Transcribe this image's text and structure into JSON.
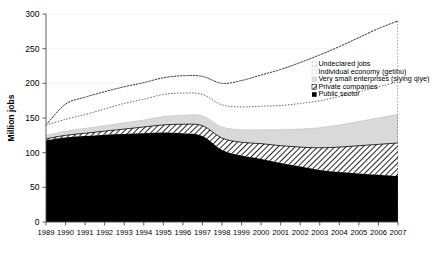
{
  "chart_data": {
    "type": "area",
    "title": "",
    "subtitle": "",
    "xlabel": "",
    "ylabel": "Million jobs",
    "stacked": true,
    "grid": false,
    "legend_position": "upper-right",
    "xlim": [
      1989,
      2007
    ],
    "ylim": [
      0,
      300
    ],
    "ytick_values": [
      0,
      50,
      100,
      150,
      200,
      250,
      300
    ],
    "ytick_labels": [
      "0",
      "50",
      "100",
      "150",
      "200",
      "250",
      "300"
    ],
    "categories": [
      "1989",
      "1990",
      "1991",
      "1992",
      "1993",
      "1994",
      "1995",
      "1996",
      "1997",
      "1998",
      "1999",
      "2000",
      "2001",
      "2002",
      "2003",
      "2004",
      "2005",
      "2006",
      "2007"
    ],
    "series": [
      {
        "name": "Public sector",
        "style": "solid-black",
        "color": "#000000",
        "values": [
          118,
          122,
          124,
          126,
          127,
          128,
          129,
          128,
          124,
          104,
          96,
          91,
          85,
          80,
          75,
          72,
          70,
          68,
          66
        ]
      },
      {
        "name": "Private companies",
        "style": "diagonal-hatch",
        "color": "#ffffff",
        "values": [
          2,
          3,
          4,
          5,
          7,
          9,
          11,
          13,
          15,
          17,
          19,
          22,
          25,
          28,
          32,
          36,
          40,
          44,
          48
        ]
      },
      {
        "name": "Very small enterprises (siying qiye)",
        "style": "light-gray",
        "color": "#d9d9d9",
        "values": [
          5,
          6,
          7,
          8,
          9,
          10,
          12,
          13,
          14,
          16,
          18,
          20,
          23,
          26,
          29,
          32,
          35,
          38,
          41
        ]
      },
      {
        "name": "Individual economy (getihu)",
        "style": "white-fill",
        "color": "#ffffff",
        "values": [
          15,
          17,
          20,
          24,
          28,
          30,
          32,
          32,
          31,
          32,
          33,
          34,
          35,
          37,
          39,
          41,
          43,
          45,
          47
        ]
      },
      {
        "name": "Undeclared jobs",
        "style": "dotted-outline",
        "color": "#ffffff",
        "values": [
          0,
          22,
          25,
          25,
          24,
          24,
          24,
          25,
          26,
          31,
          38,
          45,
          52,
          59,
          66,
          72,
          78,
          84,
          88
        ]
      }
    ],
    "series_totals": [
      140,
      170,
      180,
      188,
      195,
      201,
      208,
      211,
      210,
      200,
      204,
      212,
      220,
      230,
      241,
      253,
      266,
      279,
      290
    ],
    "legend_entries": [
      {
        "label": "Undeclared jobs",
        "swatch": "dotted-outline-swatch"
      },
      {
        "label": "Individual economy (getihu)",
        "swatch": "white-swatch"
      },
      {
        "label": "Very small enterprises (siying qiye)",
        "swatch": "light-gray-swatch"
      },
      {
        "label": "Private companies",
        "swatch": "hatched-swatch"
      },
      {
        "label": "Public sector",
        "swatch": "black-swatch"
      }
    ]
  },
  "colors": {
    "public_sector": "#000000",
    "private_companies": "#ffffff",
    "very_small_enterprises": "#d9d9d9",
    "individual_economy": "#ffffff",
    "undeclared_jobs": "#ffffff",
    "axis": "#4d4d4d",
    "background": "#ffffff"
  }
}
